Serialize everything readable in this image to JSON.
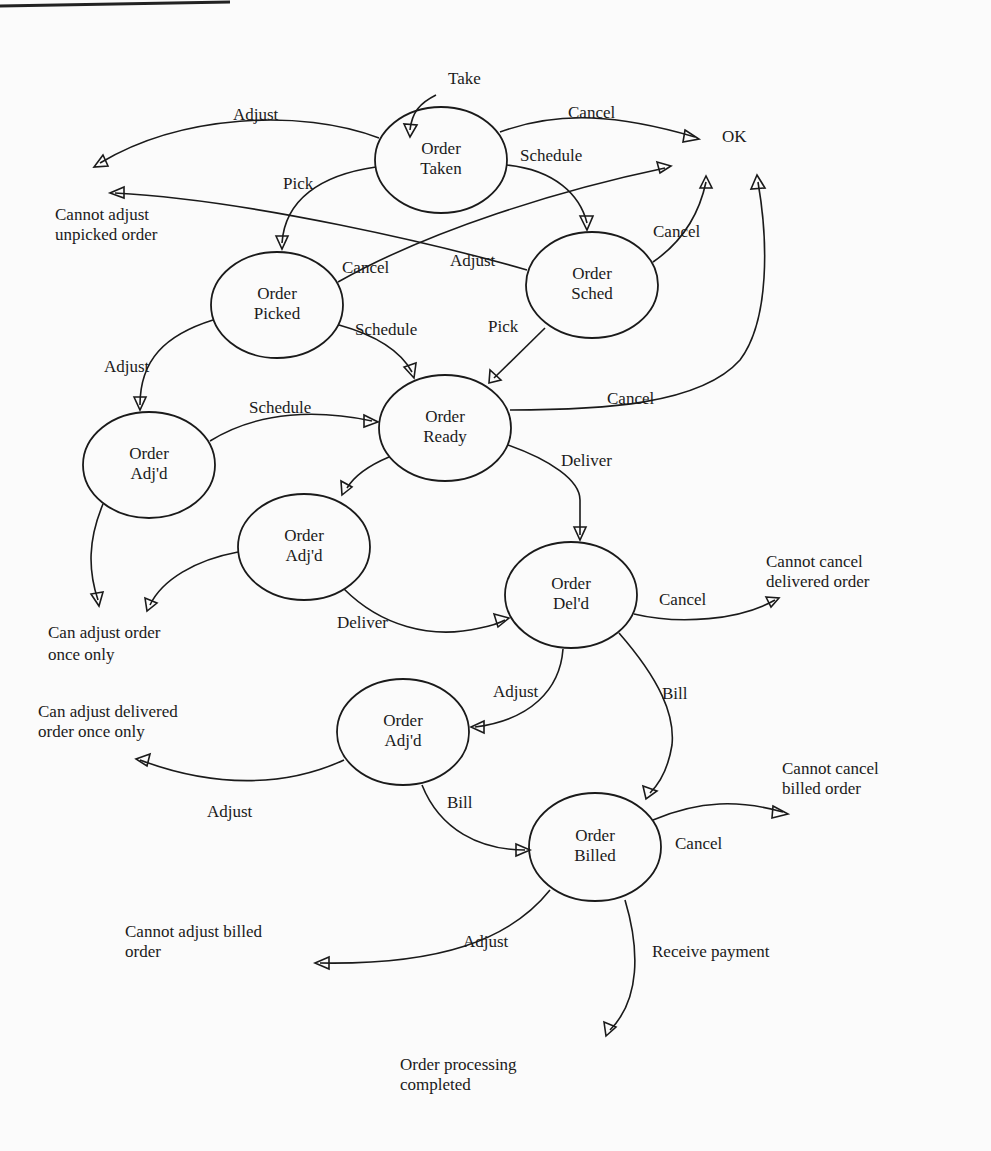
{
  "diagram": {
    "type": "state-transition",
    "colors": {
      "ink": "#1a1a1a",
      "paper": "#fbfbfb"
    },
    "nodes": [
      {
        "id": "taken",
        "line1": "Order",
        "line2": "Taken",
        "cx": 441,
        "cy": 160
      },
      {
        "id": "picked",
        "line1": "Order",
        "line2": "Picked",
        "cx": 277,
        "cy": 305
      },
      {
        "id": "sched",
        "line1": "Order",
        "line2": "Sched",
        "cx": 592,
        "cy": 285
      },
      {
        "id": "ready",
        "line1": "Order",
        "line2": "Ready",
        "cx": 445,
        "cy": 428
      },
      {
        "id": "adjd1",
        "line1": "Order",
        "line2": "Adj'd",
        "cx": 149,
        "cy": 465
      },
      {
        "id": "adjd2",
        "line1": "Order",
        "line2": "Adj'd",
        "cx": 304,
        "cy": 547
      },
      {
        "id": "deld",
        "line1": "Order",
        "line2": "Del'd",
        "cx": 571,
        "cy": 595
      },
      {
        "id": "adjd3",
        "line1": "Order",
        "line2": "Adj'd",
        "cx": 403,
        "cy": 732
      },
      {
        "id": "billed",
        "line1": "Order",
        "line2": "Billed",
        "cx": 595,
        "cy": 847
      }
    ],
    "outcomes": [
      {
        "id": "ok",
        "lines": [
          "OK"
        ]
      },
      {
        "id": "cannot-adj-unpicked",
        "lines": [
          "Cannot adjust",
          "unpicked order"
        ]
      },
      {
        "id": "can-adj-once",
        "lines": [
          "Can adjust order",
          "once only"
        ]
      },
      {
        "id": "cannot-cancel-del",
        "lines": [
          "Cannot cancel",
          "delivered order"
        ]
      },
      {
        "id": "can-adj-del-once",
        "lines": [
          "Can adjust delivered",
          "order once only"
        ]
      },
      {
        "id": "cannot-cancel-bill",
        "lines": [
          "Cannot cancel",
          "billed order"
        ]
      },
      {
        "id": "cannot-adj-bill",
        "lines": [
          "Cannot adjust billed",
          "order"
        ]
      },
      {
        "id": "completed",
        "lines": [
          "Order processing",
          "completed"
        ]
      }
    ],
    "edges": [
      {
        "from": "start",
        "to": "taken",
        "label": "Take"
      },
      {
        "from": "taken",
        "to": "ok",
        "label": "Cancel"
      },
      {
        "from": "taken",
        "to": "cannot-adj-unpicked",
        "label": "Adjust"
      },
      {
        "from": "taken",
        "to": "picked",
        "label": "Pick"
      },
      {
        "from": "taken",
        "to": "sched",
        "label": "Schedule"
      },
      {
        "from": "picked",
        "to": "ok",
        "label": "Cancel"
      },
      {
        "from": "sched",
        "to": "cannot-adj-unpicked",
        "label": "Adjust"
      },
      {
        "from": "sched",
        "to": "ok",
        "label": "Cancel"
      },
      {
        "from": "picked",
        "to": "ready",
        "label": "Schedule"
      },
      {
        "from": "sched",
        "to": "ready",
        "label": "Pick"
      },
      {
        "from": "picked",
        "to": "adjd1",
        "label": "Adjust"
      },
      {
        "from": "adjd1",
        "to": "ready",
        "label": "Schedule"
      },
      {
        "from": "ready",
        "to": "ok",
        "label": "Cancel"
      },
      {
        "from": "ready",
        "to": "deld",
        "label": "Deliver"
      },
      {
        "from": "ready",
        "to": "adjd2",
        "label": ""
      },
      {
        "from": "adjd1",
        "to": "can-adj-once",
        "label": ""
      },
      {
        "from": "adjd2",
        "to": "can-adj-once",
        "label": ""
      },
      {
        "from": "adjd2",
        "to": "deld",
        "label": "Deliver"
      },
      {
        "from": "deld",
        "to": "cannot-cancel-del",
        "label": "Cancel"
      },
      {
        "from": "deld",
        "to": "adjd3",
        "label": "Adjust"
      },
      {
        "from": "deld",
        "to": "billed",
        "label": "Bill"
      },
      {
        "from": "adjd3",
        "to": "can-adj-del-once",
        "label": "Adjust"
      },
      {
        "from": "adjd3",
        "to": "billed",
        "label": "Bill"
      },
      {
        "from": "billed",
        "to": "cannot-cancel-bill",
        "label": "Cancel"
      },
      {
        "from": "billed",
        "to": "cannot-adj-bill",
        "label": "Adjust"
      },
      {
        "from": "billed",
        "to": "completed",
        "label": "Receive payment"
      }
    ]
  },
  "labels": {
    "take": "Take",
    "cancel": "Cancel",
    "adjust": "Adjust",
    "pick": "Pick",
    "schedule": "Schedule",
    "deliver": "Deliver",
    "bill": "Bill",
    "receive_payment": "Receive payment"
  }
}
